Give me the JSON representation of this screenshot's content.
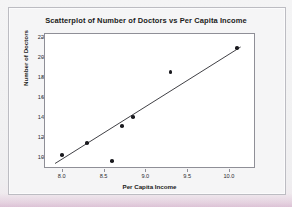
{
  "chart_data": {
    "type": "scatter",
    "title": "Scatterplot of Number of Doctors vs Per Capita Income",
    "xlabel": "Per Capita Income",
    "ylabel": "Number of Doctors",
    "xlim": [
      7.8,
      10.3
    ],
    "ylim": [
      9.0,
      22.3
    ],
    "xticks": [
      "8.0",
      "8.5",
      "9.0",
      "9.5",
      "10.0"
    ],
    "xtick_values": [
      8.0,
      8.5,
      9.0,
      9.5,
      10.0
    ],
    "yticks": [
      "10",
      "12",
      "14",
      "16",
      "18",
      "20",
      "22"
    ],
    "ytick_values": [
      10,
      12,
      14,
      16,
      18,
      20,
      22
    ],
    "grid": false,
    "legend": "none",
    "points": [
      {
        "x": 8.0,
        "y": 10.2
      },
      {
        "x": 8.3,
        "y": 11.4
      },
      {
        "x": 8.6,
        "y": 9.6
      },
      {
        "x": 8.72,
        "y": 13.1
      },
      {
        "x": 8.85,
        "y": 14.0
      },
      {
        "x": 9.3,
        "y": 18.5
      },
      {
        "x": 10.1,
        "y": 20.9
      }
    ],
    "fit_line": {
      "name": "regression line",
      "x_start": 7.92,
      "y_start": 9.35,
      "x_end": 10.14,
      "y_end": 21.0
    }
  }
}
